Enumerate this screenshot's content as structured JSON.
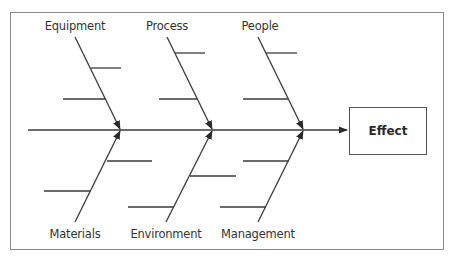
{
  "diagram": {
    "type": "fishbone",
    "effect_label": "Effect",
    "categories": {
      "top": [
        {
          "label": "Equipment",
          "x": 75
        },
        {
          "label": "Process",
          "x": 166
        },
        {
          "label": "People",
          "x": 260
        }
      ],
      "bottom": [
        {
          "label": "Materials",
          "x": 75
        },
        {
          "label": "Environment",
          "x": 166
        },
        {
          "label": "Management",
          "x": 258
        }
      ]
    },
    "colors": {
      "line": "#3a3a3a",
      "frame": "#8a8a8a",
      "text": "#333333"
    }
  }
}
